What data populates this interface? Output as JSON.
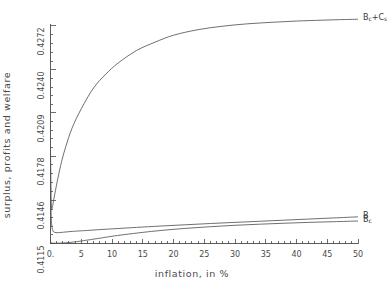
{
  "chart_data": {
    "type": "line",
    "title": "",
    "subtitle": "",
    "xlabel": "inflation, in %",
    "ylabel": "surplus, profits and welfare",
    "xlim": [
      0,
      50
    ],
    "ylim": [
      0.4115,
      0.4272
    ],
    "grid": false,
    "legend_position": "right-of-curve-ends",
    "xticks": [
      "0.",
      "5",
      "10",
      "15",
      "20",
      "25",
      "30",
      "35",
      "40",
      "45",
      "50"
    ],
    "xtick_values": [
      0,
      5,
      10,
      15,
      20,
      25,
      30,
      35,
      40,
      45,
      50
    ],
    "xminor_tick_interval": 1,
    "yticks": [
      "0.4115",
      "0.4146",
      "0.4178",
      "0.4209",
      "0.4240",
      "0.4272"
    ],
    "ytick_values": [
      0.4115,
      0.4146,
      0.4178,
      0.4209,
      0.424,
      0.4272
    ],
    "line_color": "#555555",
    "axis_color": "#4a4a4a",
    "series": [
      {
        "name": "Bc+Cs",
        "label_html": "B<sub>c</sub>+C<sub>s</sub>",
        "x": [
          0,
          0.05,
          0.1,
          0.2,
          0.35,
          0.5,
          0.8,
          1.2,
          1.8,
          2.5,
          3.5,
          5,
          7,
          9,
          11,
          14,
          17,
          20,
          24,
          28,
          32,
          36,
          40,
          44,
          47,
          50
        ],
        "values": [
          0.4185,
          0.4155,
          0.4144,
          0.414,
          0.4142,
          0.4146,
          0.4153,
          0.4162,
          0.4174,
          0.4185,
          0.4198,
          0.4212,
          0.4227,
          0.4237,
          0.4245,
          0.4254,
          0.426,
          0.4265,
          0.4269,
          0.42715,
          0.42732,
          0.42743,
          0.42752,
          0.42758,
          0.42762,
          0.42765
        ]
      },
      {
        "name": "B",
        "label_html": "B",
        "x": [
          0,
          0.04,
          0.08,
          0.15,
          0.25,
          0.4,
          0.6,
          0.9,
          1.3,
          1.8,
          2.5,
          3.5,
          4.5,
          6,
          8,
          11,
          14,
          18,
          22,
          26,
          30,
          34,
          38,
          42,
          46,
          50
        ],
        "values": [
          0.418,
          0.4153,
          0.414,
          0.4131,
          0.41265,
          0.4124,
          0.41232,
          0.41228,
          0.41228,
          0.4123,
          0.41233,
          0.41237,
          0.4124,
          0.41244,
          0.4125,
          0.41258,
          0.41266,
          0.41276,
          0.41285,
          0.41294,
          0.41302,
          0.4131,
          0.41318,
          0.41326,
          0.41334,
          0.41342
        ]
      },
      {
        "name": "Bc",
        "label_html": "B<sub>c</sub>",
        "x": [
          0,
          0.1,
          0.3,
          0.6,
          1,
          1.6,
          2.4,
          3.2,
          4,
          5,
          6.5,
          8,
          10,
          12,
          15,
          18,
          22,
          26,
          30,
          34,
          38,
          42,
          46,
          50
        ],
        "values": [
          0.4116,
          0.41156,
          0.41153,
          0.41152,
          0.41152,
          0.41153,
          0.41155,
          0.41158,
          0.41162,
          0.41168,
          0.41178,
          0.41188,
          0.41202,
          0.41214,
          0.4123,
          0.41244,
          0.41259,
          0.41271,
          0.41281,
          0.41289,
          0.41296,
          0.41302,
          0.41307,
          0.41312
        ]
      }
    ]
  },
  "labels": {
    "series_top": "Bc+Cs",
    "series_mid": "B",
    "series_bot": "Bc"
  }
}
